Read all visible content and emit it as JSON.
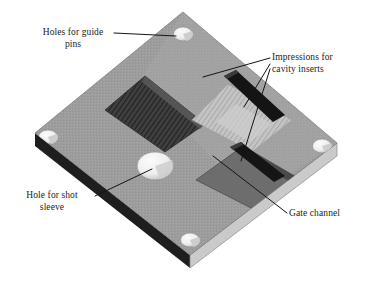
{
  "figure": {
    "background_color": "#ffffff",
    "width": 365,
    "height": 290
  },
  "labels": {
    "guide_pins": "Holes for guide\npins",
    "cavity_inserts": "Impressions for\ncavity inserts",
    "shot_sleeve": "Hole for shot\nsleeve",
    "gate_channel": "Gate channel"
  },
  "colors": {
    "plate_top": "#9d9d9d",
    "plate_top_light": "#a8a8a8",
    "edge_dark": "#1e1e1e",
    "edge_light": "#c9c9c9",
    "cavity_dark": "#4a4a4a",
    "cavity_mid": "#6e6e6e",
    "cavity_light": "#bdbdbd",
    "gate_bar": "#1c1c1c",
    "hole_fill": "#f2f2f2",
    "hole_shadow": "#b4b4b4",
    "leader_line": "#141414",
    "text": "#1b1b1b"
  },
  "plate": {
    "name": "mold-plate",
    "top_face_points": "183,12 337,143 190,255 35,133",
    "thickness_px": 13,
    "front_left_edge_points": "35,133 190,255 190,268 35,146",
    "front_right_edge_points": "190,255 337,143 337,156 190,268"
  },
  "guide_pin_holes": [
    {
      "name": "guide-pin-hole-top",
      "cx": 183,
      "cy": 34,
      "rx": 9.5,
      "ry": 7
    },
    {
      "name": "guide-pin-hole-left",
      "cx": 48,
      "cy": 137,
      "rx": 9.5,
      "ry": 7
    },
    {
      "name": "guide-pin-hole-right",
      "cx": 322,
      "cy": 146,
      "rx": 9.5,
      "ry": 7
    },
    {
      "name": "guide-pin-hole-bottom",
      "cx": 190,
      "cy": 240,
      "rx": 9.5,
      "ry": 7
    }
  ],
  "shot_sleeve_hole": {
    "name": "shot-sleeve-hole",
    "cx": 155,
    "cy": 166,
    "rx": 18,
    "ry": 14
  },
  "cavity_impressions": [
    {
      "name": "cavity-impression-left",
      "shade": "dark",
      "hatched": true,
      "points": "145,76 205,124 165,152 105,110"
    },
    {
      "name": "cavity-impression-upper-right",
      "shade": "light",
      "hatched": true,
      "points": "228,84 292,120 252,152 192,120"
    },
    {
      "name": "cavity-impression-lower-right",
      "shade": "mid",
      "hatched": false,
      "points": "243,146 298,178 255,210 196,180"
    }
  ],
  "gate_channels": [
    {
      "name": "gate-channel-upper",
      "points": "224,78 236,72 283,116 272,123"
    },
    {
      "name": "gate-channel-lower",
      "points": "231,148 241,143 283,175 273,181"
    }
  ],
  "leader_lines": [
    {
      "name": "leader-guide-pins",
      "points": "114,33 174,36"
    },
    {
      "name": "leader-cavity-insert-1",
      "points": "270,59 205,78"
    },
    {
      "name": "leader-cavity-insert-2",
      "points": "270,66 243,106"
    },
    {
      "name": "leader-cavity-insert-3",
      "points": "270,70 242,160"
    },
    {
      "name": "leader-shot-sleeve",
      "points": "95,197 152,168"
    },
    {
      "name": "leader-gate-channel",
      "points": "287,214 214,157"
    }
  ]
}
